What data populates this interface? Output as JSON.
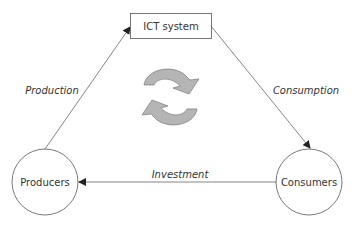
{
  "diagram": {
    "nodes": {
      "ict": {
        "label": "ICT system"
      },
      "producers": {
        "label": "Producers"
      },
      "consumers": {
        "label": "Consumers"
      }
    },
    "edges": {
      "production": {
        "label": "Production",
        "from": "Producers",
        "to": "ICT system"
      },
      "consumption": {
        "label": "Consumption",
        "from": "ICT system",
        "to": "Consumers"
      },
      "investment": {
        "label": "Investment",
        "from": "Consumers",
        "to": "Producers"
      }
    },
    "center_icon": "cycle-arrows-icon",
    "colors": {
      "stroke": "#555555",
      "arrow_fill": "#b5b5b5",
      "arrow_stroke": "#777777",
      "text": "#333333"
    }
  }
}
